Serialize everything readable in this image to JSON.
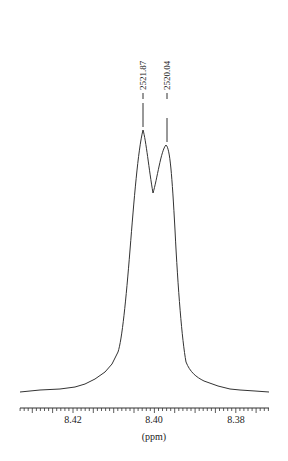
{
  "chart_data": {
    "type": "line",
    "title": "",
    "xlabel": "(ppm)",
    "ylabel": "",
    "xlim": [
      8.433,
      8.373
    ],
    "x_reversed": true,
    "x_ticks": [
      "8.42",
      "8.40",
      "8.38"
    ],
    "grid": false,
    "legend": null,
    "peak_labels": [
      "2521.87",
      "2520.04"
    ],
    "peaks": [
      {
        "ppm": 8.4025,
        "hz": 2521.87,
        "relative_height": 1.0
      },
      {
        "ppm": 8.3965,
        "hz": 2520.04,
        "relative_height": 0.95
      }
    ],
    "series": [
      {
        "name": "spectrum",
        "x": [
          8.433,
          8.425,
          8.42,
          8.416,
          8.412,
          8.409,
          8.407,
          8.4055,
          8.404,
          8.4025,
          8.401,
          8.4,
          8.399,
          8.3975,
          8.3965,
          8.395,
          8.3935,
          8.392,
          8.39,
          8.387,
          8.383,
          8.379,
          8.373
        ],
        "values": [
          0.01,
          0.02,
          0.03,
          0.06,
          0.12,
          0.25,
          0.45,
          0.7,
          0.92,
          1.0,
          0.85,
          0.73,
          0.8,
          0.92,
          0.95,
          0.85,
          0.6,
          0.35,
          0.16,
          0.1,
          0.05,
          0.03,
          0.02
        ]
      }
    ]
  },
  "axis": {
    "xlabel": "(ppm)",
    "ticks": [
      "8.42",
      "8.40",
      "8.38"
    ]
  },
  "annotations": {
    "peak1": "2521.87",
    "peak2": "2520.04"
  }
}
